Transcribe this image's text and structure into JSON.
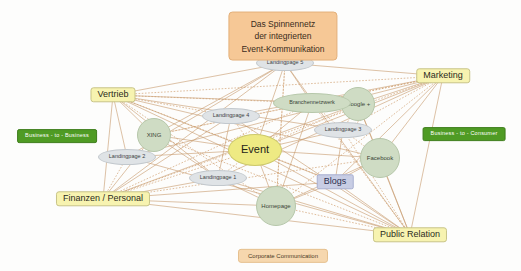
{
  "diagram": {
    "title_lines": [
      "Das Spinnennetz",
      "der integrierten",
      "Event-Kommunikation"
    ],
    "footer_label": "Corporate Communication",
    "colors": {
      "background": "#fdfdfc",
      "edge_solid": "#c79a6b",
      "edge_dotted": "#d0a070",
      "department": "#f7f3b0",
      "event": "#eeea83",
      "social": "#cfdcc4",
      "landing": "#dfe3e6",
      "blogs": "#c8cde4",
      "market": "#4f9b24",
      "title": "#f6c896",
      "footer": "#f6d7ae"
    },
    "nodes": [
      {
        "id": "event",
        "label": "Event",
        "type": "event",
        "x": 255,
        "y": 150
      },
      {
        "id": "vertrieb",
        "label": "Vertrieb",
        "type": "dept",
        "x": 113,
        "y": 95
      },
      {
        "id": "marketing",
        "label": "Marketing",
        "type": "dept",
        "x": 443,
        "y": 76
      },
      {
        "id": "finanzen",
        "label": "Finanzen / Personal",
        "type": "dept",
        "x": 103,
        "y": 199
      },
      {
        "id": "public-relation",
        "label": "Public Relation",
        "type": "dept",
        "x": 410,
        "y": 235
      },
      {
        "id": "blogs",
        "label": "Blogs",
        "type": "blogs",
        "x": 335,
        "y": 182
      },
      {
        "id": "xing",
        "label": "XING",
        "type": "social",
        "x": 154,
        "y": 135
      },
      {
        "id": "google-plus",
        "label": "Google +",
        "type": "social",
        "x": 358,
        "y": 104
      },
      {
        "id": "facebook",
        "label": "Facebook",
        "type": "social-big",
        "x": 380,
        "y": 158
      },
      {
        "id": "homepage",
        "label": "Homepage",
        "type": "social-big",
        "x": 276,
        "y": 206
      },
      {
        "id": "branchennetzwerk",
        "label": "Branchennetzwerk",
        "type": "social-wide",
        "x": 312,
        "y": 103
      },
      {
        "id": "landingpage-1",
        "label": "Landingpage 1",
        "type": "landing",
        "x": 218,
        "y": 178
      },
      {
        "id": "landingpage-2",
        "label": "Landingpage 2",
        "type": "landing",
        "x": 127,
        "y": 157
      },
      {
        "id": "landingpage-3",
        "label": "Landingpage 3",
        "type": "landing",
        "x": 343,
        "y": 130
      },
      {
        "id": "landingpage-4",
        "label": "Landingpage 4",
        "type": "landing",
        "x": 231,
        "y": 116
      },
      {
        "id": "landingpage-5",
        "label": "Landingpage 5",
        "type": "landing",
        "x": 285,
        "y": 63
      },
      {
        "id": "b2b",
        "label": "Business - to - Business",
        "type": "market",
        "x": 57,
        "y": 136
      },
      {
        "id": "b2c",
        "label": "Business - to - Consumer",
        "type": "market",
        "x": 464,
        "y": 134
      }
    ],
    "edges": [
      [
        "vertrieb",
        "marketing"
      ],
      [
        "vertrieb",
        "finanzen"
      ],
      [
        "vertrieb",
        "public-relation"
      ],
      [
        "vertrieb",
        "event"
      ],
      [
        "vertrieb",
        "xing"
      ],
      [
        "vertrieb",
        "landingpage-2"
      ],
      [
        "vertrieb",
        "landingpage-4"
      ],
      [
        "vertrieb",
        "landingpage-5"
      ],
      [
        "vertrieb",
        "landingpage-3"
      ],
      [
        "vertrieb",
        "branchennetzwerk"
      ],
      [
        "vertrieb",
        "google-plus"
      ],
      [
        "vertrieb",
        "facebook"
      ],
      [
        "vertrieb",
        "homepage"
      ],
      [
        "vertrieb",
        "blogs"
      ],
      [
        "vertrieb",
        "landingpage-1"
      ],
      [
        "marketing",
        "finanzen"
      ],
      [
        "marketing",
        "public-relation"
      ],
      [
        "marketing",
        "event"
      ],
      [
        "marketing",
        "xing"
      ],
      [
        "marketing",
        "landingpage-1"
      ],
      [
        "marketing",
        "landingpage-2"
      ],
      [
        "marketing",
        "landingpage-3"
      ],
      [
        "marketing",
        "landingpage-4"
      ],
      [
        "marketing",
        "landingpage-5"
      ],
      [
        "marketing",
        "branchennetzwerk"
      ],
      [
        "marketing",
        "google-plus"
      ],
      [
        "marketing",
        "facebook"
      ],
      [
        "marketing",
        "homepage"
      ],
      [
        "marketing",
        "blogs"
      ],
      [
        "finanzen",
        "public-relation"
      ],
      [
        "finanzen",
        "event"
      ],
      [
        "finanzen",
        "xing"
      ],
      [
        "finanzen",
        "landingpage-1"
      ],
      [
        "finanzen",
        "landingpage-2"
      ],
      [
        "finanzen",
        "landingpage-4"
      ],
      [
        "finanzen",
        "landingpage-5"
      ],
      [
        "finanzen",
        "branchennetzwerk"
      ],
      [
        "finanzen",
        "homepage"
      ],
      [
        "finanzen",
        "blogs"
      ],
      [
        "finanzen",
        "facebook"
      ],
      [
        "finanzen",
        "google-plus"
      ],
      [
        "public-relation",
        "event"
      ],
      [
        "public-relation",
        "xing"
      ],
      [
        "public-relation",
        "landingpage-1"
      ],
      [
        "public-relation",
        "landingpage-2"
      ],
      [
        "public-relation",
        "landingpage-3"
      ],
      [
        "public-relation",
        "landingpage-4"
      ],
      [
        "public-relation",
        "landingpage-5"
      ],
      [
        "public-relation",
        "branchennetzwerk"
      ],
      [
        "public-relation",
        "google-plus"
      ],
      [
        "public-relation",
        "facebook"
      ],
      [
        "public-relation",
        "homepage"
      ],
      [
        "public-relation",
        "blogs"
      ],
      [
        "event",
        "xing"
      ],
      [
        "event",
        "landingpage-1"
      ],
      [
        "event",
        "landingpage-2"
      ],
      [
        "event",
        "landingpage-3"
      ],
      [
        "event",
        "landingpage-4"
      ],
      [
        "event",
        "landingpage-5"
      ],
      [
        "event",
        "branchennetzwerk"
      ],
      [
        "event",
        "google-plus"
      ],
      [
        "event",
        "facebook"
      ],
      [
        "event",
        "homepage"
      ],
      [
        "event",
        "blogs"
      ],
      [
        "branchennetzwerk",
        "google-plus"
      ],
      [
        "branchennetzwerk",
        "landingpage-5"
      ],
      [
        "branchennetzwerk",
        "landingpage-3"
      ],
      [
        "branchennetzwerk",
        "homepage"
      ],
      [
        "google-plus",
        "facebook"
      ],
      [
        "google-plus",
        "landingpage-3"
      ],
      [
        "facebook",
        "blogs"
      ],
      [
        "facebook",
        "homepage"
      ],
      [
        "facebook",
        "landingpage-3"
      ],
      [
        "homepage",
        "blogs"
      ],
      [
        "homepage",
        "landingpage-1"
      ],
      [
        "homepage",
        "landingpage-5"
      ],
      [
        "xing",
        "landingpage-5"
      ],
      [
        "xing",
        "landingpage-1"
      ],
      [
        "xing",
        "branchennetzwerk"
      ],
      [
        "landingpage-2",
        "landingpage-5"
      ],
      [
        "landingpage-4",
        "landingpage-1"
      ],
      [
        "landingpage-5",
        "homepage"
      ],
      [
        "blogs",
        "landingpage-3"
      ]
    ]
  }
}
